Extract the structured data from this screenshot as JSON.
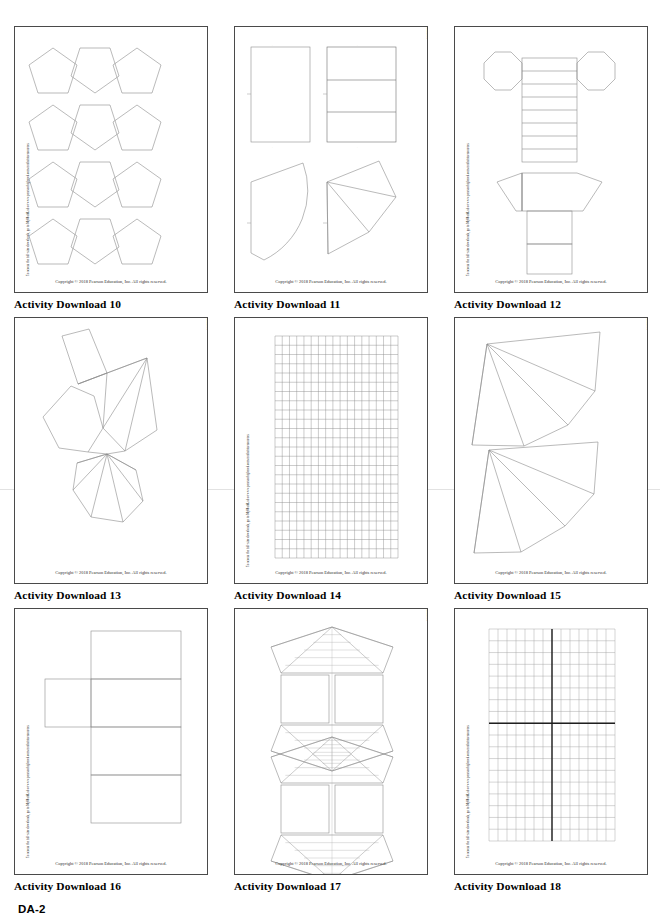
{
  "document": {
    "folio": "DA-2",
    "vertical_note": "To access the full-size downloads, go to MyMathLab or www.pearsonhighered.com/mathstatsresources",
    "copyright": "Copyright © 2018 Pearson Education, Inc. All rights reserved.",
    "ink_color": "#6f6f6f",
    "frame_color": "#4a4a4a",
    "text_color": "#2b2b2b"
  },
  "pages": [
    {
      "id": "activity-download-10",
      "caption": "Activity Download 10",
      "note_side": "left",
      "artwork": "pentagon-tiling",
      "artwork_description": "Twelve congruent regular pentagons arranged in four rows of three, alternating point-up and point-down orientation"
    },
    {
      "id": "activity-download-11",
      "caption": "Activity Download 11",
      "note_side": "right",
      "artwork": "rectangles-and-sectors",
      "artwork_description": "Two rectangles on top (one plain, one divided into three horizontal bands) and two curved/triangular fan sectors below"
    },
    {
      "id": "activity-download-12",
      "caption": "Activity Download 12",
      "note_side": "left",
      "artwork": "octagonal-prism-net",
      "artwork_description": "Net of an octagonal prism: two octagon bases flanking a strip of rectangles, with a trapezoidal flare and tab below"
    },
    {
      "id": "activity-download-13",
      "caption": "Activity Download 13",
      "note_side": "right",
      "artwork": "polyhedron-net",
      "artwork_description": "Irregular polyhedron net: a tilted quadrilateral, hexagon, triangulated fan and a lower radial fan of triangles"
    },
    {
      "id": "activity-download-14",
      "caption": "Activity Download 14",
      "note_side": "left",
      "artwork": "square-grid",
      "artwork_description": "Plain square grid, 17 columns by 24 rows",
      "grid": {
        "cols": 17,
        "rows": 24
      }
    },
    {
      "id": "activity-download-15",
      "caption": "Activity Download 15",
      "note_side": "right",
      "artwork": "two-fan-nets",
      "artwork_description": "Two large fan-shaped nets of triangles, each radiating from an upper-left apex"
    },
    {
      "id": "activity-download-16",
      "caption": "Activity Download 16",
      "note_side": "left",
      "artwork": "box-net",
      "artwork_description": "Net of a rectangular box: a vertical column of three rectangles with one rectangle attached at the left"
    },
    {
      "id": "activity-download-17",
      "caption": "Activity Download 17",
      "note_side": "right",
      "artwork": "pyramid-nets",
      "artwork_description": "Two identical pyramid nets, each with striped fan sections above and below a pair of squares"
    },
    {
      "id": "activity-download-18",
      "caption": "Activity Download 18",
      "note_side": "left",
      "artwork": "coordinate-grid",
      "artwork_description": "Coordinate plane grid, 14 columns by 18 rows, with bold x-axis and y-axis through the centre",
      "grid": {
        "cols": 14,
        "rows": 18,
        "axis_col": 7,
        "axis_row": 8
      }
    }
  ]
}
